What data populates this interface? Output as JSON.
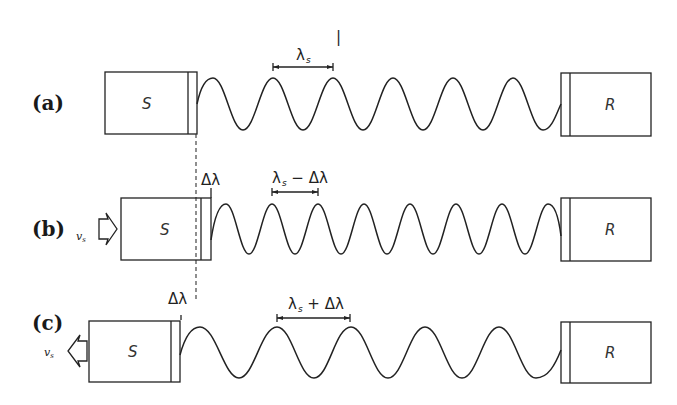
{
  "figure": {
    "panels": [
      {
        "id": "a",
        "label": "(a)",
        "source_label": "S",
        "receiver_label": "R",
        "wavelength_label": "λ",
        "wavelength_sub": "s",
        "source_motion": "none",
        "delta_label": ""
      },
      {
        "id": "b",
        "label": "(b)",
        "source_label": "S",
        "receiver_label": "R",
        "wavelength_label": "λ",
        "wavelength_sub": "s",
        "wavelength_suffix": " − Δλ",
        "source_motion": "toward receiver",
        "velocity_label": "v",
        "velocity_sub": "s",
        "delta_label": "Δλ"
      },
      {
        "id": "c",
        "label": "(c)",
        "source_label": "S",
        "receiver_label": "R",
        "wavelength_label": "λ",
        "wavelength_sub": "s",
        "wavelength_suffix": " + Δλ",
        "source_motion": "away from receiver",
        "velocity_label": "v",
        "velocity_sub": "s",
        "delta_label": "Δλ"
      }
    ],
    "stray_mark": "|"
  }
}
